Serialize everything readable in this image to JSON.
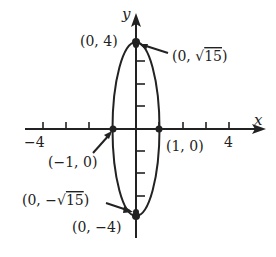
{
  "diagram": {
    "type": "ellipse-graph",
    "equation_shape": "vertical ellipse centered at origin",
    "axes": {
      "x_label": "x",
      "y_label": "y",
      "x_tick_labels": [
        {
          "value": -4,
          "text": "−4"
        },
        {
          "value": 4,
          "text": "4"
        }
      ],
      "x_ticks": [
        -4,
        -3,
        -2,
        -1,
        1,
        2,
        3,
        4
      ],
      "y_ticks": [
        -3,
        -2,
        -1,
        1,
        2,
        3
      ]
    },
    "points": [
      {
        "id": "top-vertex",
        "x": 0,
        "y": 4,
        "text": "(0, 4)"
      },
      {
        "id": "top-focus",
        "x": 0,
        "y": 3.873,
        "text_prefix": "(0, ",
        "text_root": "15",
        "text_suffix": ")"
      },
      {
        "id": "left-covertex",
        "x": -1,
        "y": 0,
        "text": "(−1, 0)"
      },
      {
        "id": "right-covertex",
        "x": 1,
        "y": 0,
        "text": "(1, 0)"
      },
      {
        "id": "bottom-focus",
        "x": 0,
        "y": -3.873,
        "text_prefix": "(0, −",
        "text_root": "15",
        "text_suffix": ")"
      },
      {
        "id": "bottom-vertex",
        "x": 0,
        "y": -4,
        "text": "(0, −4)"
      }
    ],
    "colors": {
      "ink": "#222222",
      "background": "#ffffff"
    }
  }
}
